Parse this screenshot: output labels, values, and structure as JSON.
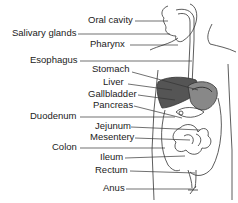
{
  "diagram": {
    "labels": [
      {
        "text": "Oral cavity",
        "x": 88,
        "y": 15,
        "lx1": 135,
        "lx2": 168,
        "ly": 21
      },
      {
        "text": "Salivary glands",
        "x": 12,
        "y": 28,
        "lx1": 78,
        "lx2": 170,
        "ly": 34
      },
      {
        "text": "Pharynx",
        "x": 90,
        "y": 39,
        "lx1": 130,
        "lx2": 178,
        "ly": 45
      },
      {
        "text": "Esophagus",
        "x": 30,
        "y": 55,
        "lx1": 80,
        "lx2": 192,
        "ly": 61
      },
      {
        "text": "Stomach",
        "x": 92,
        "y": 64,
        "lx1": 132,
        "lx2": 198,
        "ly": 72,
        "ly2": 90
      },
      {
        "text": "Liver",
        "x": 103,
        "y": 77,
        "lx1": 128,
        "lx2": 172,
        "ly": 84,
        "ly2": 90
      },
      {
        "text": "Gallbladder",
        "x": 88,
        "y": 89,
        "lx1": 138,
        "lx2": 175,
        "ly": 95,
        "ly2": 100
      },
      {
        "text": "Pancreas",
        "x": 93,
        "y": 100,
        "lx1": 134,
        "lx2": 182,
        "ly": 106,
        "ly2": 118
      },
      {
        "text": "Duodenum",
        "x": 30,
        "y": 111,
        "lx1": 80,
        "lx2": 175,
        "ly": 117
      },
      {
        "text": "Jejunum",
        "x": 95,
        "y": 121,
        "lx1": 131,
        "lx2": 200,
        "ly": 127,
        "ly2": 130
      },
      {
        "text": "Mesentery",
        "x": 90,
        "y": 132,
        "lx1": 135,
        "lx2": 190,
        "ly": 138,
        "ly2": 140
      },
      {
        "text": "Colon",
        "x": 52,
        "y": 142,
        "lx1": 80,
        "lx2": 165,
        "ly": 148
      },
      {
        "text": "Ileum",
        "x": 100,
        "y": 152,
        "lx1": 125,
        "lx2": 185,
        "ly": 158,
        "ly2": 156
      },
      {
        "text": "Rectum",
        "x": 95,
        "y": 165,
        "lx1": 130,
        "lx2": 195,
        "ly": 171,
        "ly2": 173
      },
      {
        "text": "Anus",
        "x": 103,
        "y": 183,
        "lx1": 126,
        "lx2": 194,
        "ly": 189
      }
    ]
  }
}
